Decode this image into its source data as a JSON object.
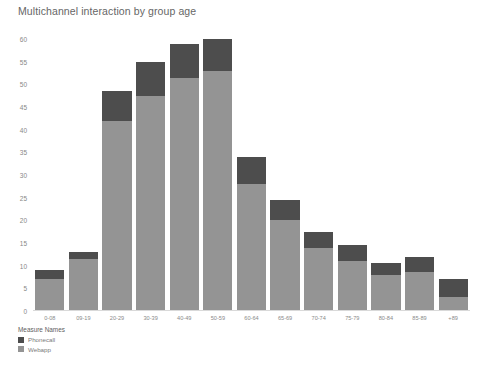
{
  "chart_data": {
    "type": "bar",
    "subtype": "stacked-vertical",
    "title": "Multichannel interaction by group age",
    "xlabel": "",
    "ylabel": "",
    "ylim": [
      0,
      60
    ],
    "ytick_step": 5,
    "yticks": [
      "0",
      "5",
      "10",
      "15",
      "20",
      "25",
      "30",
      "35",
      "40",
      "45",
      "50",
      "55",
      "60"
    ],
    "grid": false,
    "legend_position": "bottom-left",
    "legend_title": "Measure Names",
    "categories": [
      "0-08",
      "09-19",
      "20-29",
      "30-39",
      "40-49",
      "50-59",
      "60-64",
      "65-69",
      "70-74",
      "75-79",
      "80-84",
      "85-89",
      "+89"
    ],
    "series": [
      {
        "name": "Webapp",
        "color": "#949494",
        "values": [
          7,
          11.5,
          42,
          47.5,
          51.5,
          53,
          28,
          20,
          14,
          11,
          8,
          8.5,
          3
        ]
      },
      {
        "name": "Phonecall",
        "color": "#4d4d4d",
        "values": [
          2,
          1.5,
          6.5,
          7.5,
          7.5,
          7,
          6,
          4.5,
          3.5,
          3.5,
          2.5,
          3.5,
          4
        ]
      }
    ],
    "totals": [
      9,
      13,
      48.5,
      55,
      59,
      60,
      34,
      24.5,
      17.5,
      14.5,
      10.5,
      12,
      7
    ]
  },
  "colors": {
    "background": "#ffffff",
    "title_text": "#666666",
    "tick_text": "#888888",
    "axis_line": "#d9d9d9",
    "phonecall": "#4d4d4d",
    "webapp": "#949494"
  }
}
